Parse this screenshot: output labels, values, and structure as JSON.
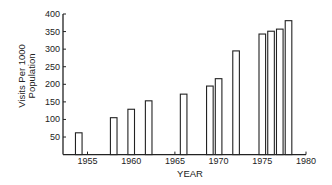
{
  "chart_data": {
    "type": "bar",
    "title": "",
    "xlabel": "YEAR",
    "ylabel": "Visits Per 1000 Population",
    "ylabel_lines": [
      "Visits Per 1000",
      "Population"
    ],
    "x": [
      1954,
      1958,
      1960,
      1962,
      1966,
      1969,
      1970,
      1972,
      1975,
      1976,
      1977,
      1978
    ],
    "values": [
      62,
      105,
      129,
      153,
      172,
      195,
      216,
      295,
      343,
      351,
      357,
      381
    ],
    "xlim": [
      1951,
      1980
    ],
    "ylim": [
      0,
      400
    ],
    "x_ticks": [
      1955,
      1960,
      1965,
      1970,
      1975,
      1980
    ],
    "y_ticks": [
      50,
      100,
      150,
      200,
      250,
      300,
      350,
      400
    ],
    "grid": false,
    "legend": null,
    "bar_style": "hollow outline"
  },
  "colors": {
    "stroke": "#222222",
    "background": "#ffffff"
  }
}
